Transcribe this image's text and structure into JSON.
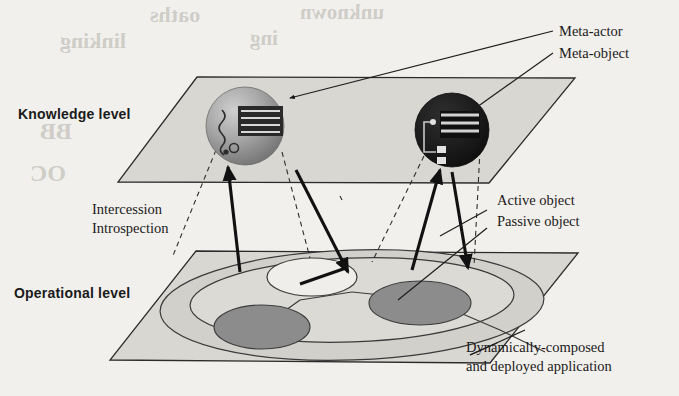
{
  "figure": {
    "type": "two-level reflective architecture diagram",
    "levels": [
      {
        "id": "knowledge",
        "label": "Knowledge level"
      },
      {
        "id": "operational",
        "label": "Operational level"
      }
    ],
    "callouts": [
      {
        "id": "meta-actor",
        "label": "Meta-actor"
      },
      {
        "id": "meta-object",
        "label": "Meta-object"
      },
      {
        "id": "active-object",
        "label": "Active object"
      },
      {
        "id": "passive-object",
        "label": "Passive object"
      }
    ],
    "relations": [
      {
        "id": "intercession",
        "label": "Intercession"
      },
      {
        "id": "introspection",
        "label": "Introspection"
      }
    ],
    "caption": {
      "line1": "Dynamically-composed",
      "line2": "and deployed application"
    },
    "colors": {
      "plane_fill": "#d9d7d2",
      "plane_stroke": "#2b2b2b",
      "sphere_meta_actor": "#9b9b9b",
      "sphere_meta_object": "#1b1b1b",
      "object_dark_fill": "#8c8c8c",
      "object_light_fill": "#efeeea",
      "arrow_solid": "#111111",
      "arrow_dashed": "#333333",
      "page_background": "#f2f0ec",
      "text": "#1a1a1a"
    }
  },
  "bleed_through": {
    "t1": "oaths",
    "t2": "unknown",
    "t3": "linking",
    "t4": "ing",
    "t5": "BB",
    "t6": "OC"
  }
}
